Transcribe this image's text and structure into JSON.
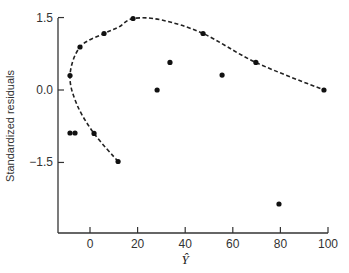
{
  "chart_data": {
    "type": "scatter",
    "title": "",
    "xlabel": "Ŷ",
    "ylabel": "Standardized residuals",
    "xlim": [
      -13,
      103
    ],
    "ylim": [
      -3.0,
      1.5
    ],
    "xticks": [
      0,
      20,
      40,
      60,
      80,
      100
    ],
    "xtick_labels": [
      "0",
      "20",
      "40",
      "60",
      "80",
      "100"
    ],
    "yticks": [
      1.5,
      0.0,
      -1.5
    ],
    "ytick_labels": [
      "1.5",
      "0.0",
      "−1.5"
    ],
    "grid": false,
    "legend": null,
    "points": [
      {
        "x": -8.4,
        "y": 0.3
      },
      {
        "x": -4.2,
        "y": 0.89
      },
      {
        "x": 5.9,
        "y": 1.17
      },
      {
        "x": 18.1,
        "y": 1.48
      },
      {
        "x": 47.5,
        "y": 1.17
      },
      {
        "x": 69.7,
        "y": 0.57
      },
      {
        "x": 98.3,
        "y": 0.0
      },
      {
        "x": -8.4,
        "y": -0.89
      },
      {
        "x": -6.3,
        "y": -0.89
      },
      {
        "x": 1.7,
        "y": -0.9
      },
      {
        "x": 11.8,
        "y": -1.48
      },
      {
        "x": 28.2,
        "y": 0.0
      },
      {
        "x": 33.6,
        "y": 0.57
      },
      {
        "x": 55.5,
        "y": 0.31
      },
      {
        "x": 79.4,
        "y": -2.36
      }
    ],
    "dashed_curve": [
      {
        "x": 11.8,
        "y": -1.48
      },
      {
        "x": 1.7,
        "y": -0.9
      },
      {
        "x": -5.5,
        "y": -0.3
      },
      {
        "x": -8.4,
        "y": 0.3
      },
      {
        "x": -4.2,
        "y": 0.89
      },
      {
        "x": 5.9,
        "y": 1.17
      },
      {
        "x": 12.0,
        "y": 1.3
      },
      {
        "x": 18.1,
        "y": 1.48
      },
      {
        "x": 30.0,
        "y": 1.45
      },
      {
        "x": 47.5,
        "y": 1.17
      },
      {
        "x": 69.7,
        "y": 0.57
      },
      {
        "x": 98.3,
        "y": 0.0
      }
    ]
  }
}
